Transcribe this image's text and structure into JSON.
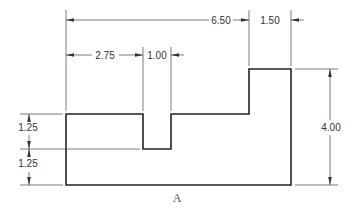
{
  "drawing": {
    "type": "orthographic-view-dimensioned",
    "view_label": "A",
    "colors": {
      "outline": "#222222",
      "dimension": "#444444",
      "text": "#333333",
      "background": "#ffffff"
    },
    "dimensions": {
      "overall_to_step": {
        "value": "6.50",
        "orientation": "horizontal",
        "description": "left edge to start of raised block"
      },
      "raised_block_width": {
        "value": "1.50",
        "orientation": "horizontal",
        "description": "width of raised block"
      },
      "left_to_notch": {
        "value": "2.75",
        "orientation": "horizontal",
        "description": "left edge to notch"
      },
      "notch_width": {
        "value": "1.00",
        "orientation": "horizontal",
        "description": "width of notch"
      },
      "overall_height": {
        "value": "4.00",
        "orientation": "vertical",
        "description": "total height at raised block"
      },
      "upper_height": {
        "value": "1.25",
        "orientation": "vertical",
        "description": "notch depth / upper band"
      },
      "lower_height": {
        "value": "1.25",
        "orientation": "vertical",
        "description": "base thickness under notch"
      }
    }
  }
}
